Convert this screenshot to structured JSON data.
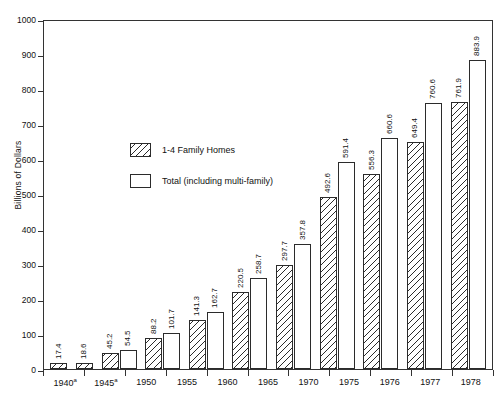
{
  "chart_data": {
    "type": "bar",
    "title": "",
    "xlabel": "",
    "ylabel": "Billions of Dollars",
    "ylim": [
      0,
      1000
    ],
    "ytick_values": [
      0,
      100,
      200,
      300,
      400,
      500,
      600,
      700,
      800,
      900,
      1000
    ],
    "ytick_labels": [
      "0",
      "100",
      "200",
      "300",
      "400",
      "500",
      "600",
      "700",
      "800",
      "900",
      "1000"
    ],
    "grid": false,
    "legend_position": "upper left inside",
    "categories": [
      "1940",
      "1945",
      "1950",
      "1955",
      "1960",
      "1965",
      "1970",
      "1975",
      "1976",
      "1977",
      "1978"
    ],
    "category_labels": [
      "1940",
      "1945",
      "1950",
      "1955",
      "1960",
      "1965",
      "1970",
      "1975",
      "1976",
      "1977",
      "1978"
    ],
    "category_footnotes": [
      "a",
      "a",
      "",
      "",
      "",
      "",
      "",
      "",
      "",
      "",
      ""
    ],
    "series": [
      {
        "name": "1-4 Family Homes",
        "style": "hatched",
        "values": [
          17.4,
          18.6,
          45.2,
          88.2,
          141.3,
          220.5,
          297.7,
          492.6,
          556.3,
          649.4,
          761.9
        ],
        "value_labels": [
          "17.4",
          "18.6",
          "45.2",
          "88.2",
          "141.3",
          "220.5",
          "297.7",
          "492.6",
          "556.3",
          "649.4",
          "761.9"
        ]
      },
      {
        "name": "Total (including multi-family)",
        "style": "open",
        "values": [
          null,
          null,
          54.5,
          101.7,
          162.7,
          258.7,
          357.8,
          591.4,
          660.6,
          760.6,
          883.9
        ],
        "value_labels": [
          "",
          "",
          "54.5",
          "101.7",
          "162.7",
          "258.7",
          "357.8",
          "591.4",
          "660.6",
          "760.6",
          "883.9"
        ]
      }
    ]
  },
  "legend": {
    "items": [
      {
        "label": "1-4 Family Homes",
        "style": "hatched"
      },
      {
        "label": "Total (including multi-family)",
        "style": "open"
      }
    ]
  },
  "colors": {
    "axis": "#333333",
    "bar_outline": "#2b2b2b",
    "background": "#ffffff",
    "text": "#111111"
  }
}
